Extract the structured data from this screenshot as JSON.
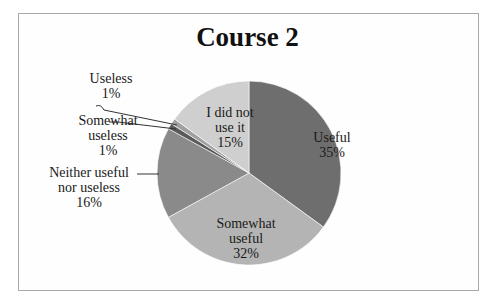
{
  "chart_data": {
    "type": "pie",
    "title": "Course 2",
    "categories": [
      "Useful",
      "Somewhat useful",
      "Neither useful nor useless",
      "Somewhat useless",
      "Useless",
      "I did not use it"
    ],
    "values": [
      35,
      32,
      16,
      1,
      1,
      15
    ],
    "unit": "%",
    "colors": [
      "#6e6e6e",
      "#b4b4b4",
      "#8a8a8a",
      "#5a5a5a",
      "#a0a0a0",
      "#cfcfcf"
    ],
    "legend": "none",
    "data_labels": [
      {
        "name": "Useful",
        "line1": "Useful",
        "line2": "35%"
      },
      {
        "name": "Somewhat useful",
        "line1": "Somewhat",
        "line2": "useful",
        "line3": "32%"
      },
      {
        "name": "Neither useful nor useless",
        "line1": "Neither useful",
        "line2": "nor useless",
        "line3": "16%"
      },
      {
        "name": "Somewhat useless",
        "line1": "Somewhat",
        "line2": "useless",
        "line3": "1%"
      },
      {
        "name": "Useless",
        "line1": "Useless",
        "line2": "1%"
      },
      {
        "name": "I did not use it",
        "line1": "I did not",
        "line2": "use it",
        "line3": "15%"
      }
    ]
  }
}
